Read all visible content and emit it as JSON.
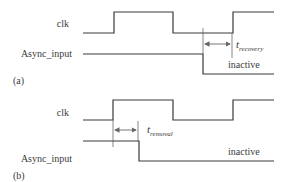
{
  "panels": [
    {
      "id": "a",
      "tag": "(a)",
      "signals": {
        "clk": "clk",
        "async": "Async_input"
      },
      "timing_label": {
        "main": "t",
        "sub": "recovery"
      },
      "state_label": "inactive"
    },
    {
      "id": "b",
      "tag": "(b)",
      "signals": {
        "clk": "clk",
        "async": "Async_input"
      },
      "timing_label": {
        "main": "t",
        "sub": "removal"
      },
      "state_label": "inactive"
    }
  ]
}
